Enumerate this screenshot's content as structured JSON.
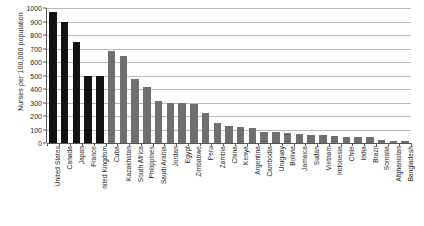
{
  "chart_data": {
    "type": "bar",
    "title": "",
    "xlabel": "",
    "ylabel": "Nurses per 100,000 population",
    "ylim": [
      0,
      1000
    ],
    "ytick_step": 100,
    "grid": true,
    "legend": "none",
    "yticks": [
      "1000",
      "900",
      "800",
      "700",
      "600",
      "500",
      "400",
      "300",
      "200",
      "100",
      "0"
    ],
    "categories": [
      "United States",
      "Canada",
      "Japan",
      "France",
      "United Kingdom",
      "Cuba",
      "Kazakhstan",
      "South Africa",
      "Philippines",
      "Saudi Arabia",
      "Jordan",
      "Egypt",
      "Zimbabwe",
      "Peru",
      "Zambia",
      "China",
      "Kenya",
      "Argentina",
      "Cambodia",
      "Uruguay",
      "Bolivia",
      "Jamaica",
      "Sudan",
      "Vietnam",
      "Indonesia",
      "Chile",
      "India",
      "Brazil",
      "Somalia",
      "Afghanistan",
      "Bangladesh"
    ],
    "tick_labels": [
      "United States",
      "Canada",
      "Japan",
      "France",
      "nited Kingdom",
      "Cuba",
      "Kazakhstan",
      "South Africa",
      "Philippines",
      "Saudi Arabia",
      "Jordan",
      "Egypt",
      "Zimbabwe",
      "Peru",
      "Zambia",
      "China",
      "Kenya",
      "Argentina",
      "Cambodia",
      "Uruguay",
      "Bolivia",
      "Jamaica",
      "Sudan",
      "Vietnam",
      "Indonesia",
      "Chile",
      "India",
      "Brazil",
      "Somalia",
      "Afghanistan",
      "Bangladesh"
    ],
    "values": [
      972,
      898,
      745,
      497,
      494,
      678,
      648,
      471,
      413,
      312,
      300,
      295,
      292,
      220,
      148,
      125,
      120,
      108,
      80,
      78,
      73,
      65,
      63,
      56,
      50,
      45,
      45,
      41,
      20,
      18,
      12
    ],
    "bar_colors": [
      "#121212",
      "#121212",
      "#121212",
      "#121212",
      "#121212",
      "#6f6f6f",
      "#6f6f6f",
      "#6f6f6f",
      "#6f6f6f",
      "#6f6f6f",
      "#6f6f6f",
      "#6f6f6f",
      "#6f6f6f",
      "#6f6f6f",
      "#6f6f6f",
      "#6f6f6f",
      "#6f6f6f",
      "#6f6f6f",
      "#6f6f6f",
      "#6f6f6f",
      "#6f6f6f",
      "#6f6f6f",
      "#6f6f6f",
      "#6f6f6f",
      "#6f6f6f",
      "#6f6f6f",
      "#6f6f6f",
      "#6f6f6f",
      "#6f6f6f",
      "#6f6f6f",
      "#6f6f6f"
    ],
    "colors": {
      "dark_series": "#121212",
      "light_series": "#6f6f6f",
      "gridline": "#b9b9b9",
      "axis": "#555555",
      "background": "#ffffff",
      "text": "#1a1a1a"
    }
  }
}
